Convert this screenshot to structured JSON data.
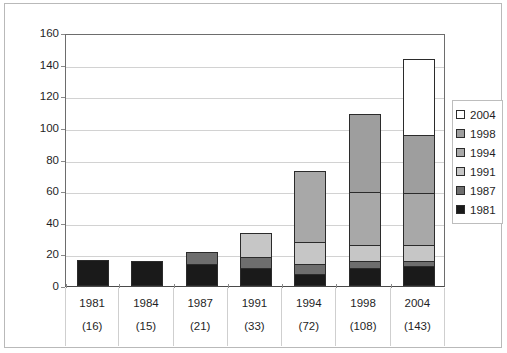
{
  "chart_title": "",
  "legend": {
    "position": "right",
    "entries": [
      {
        "label": "2004",
        "color": "#ffffff"
      },
      {
        "label": "1998",
        "color": "#9e9e9e"
      },
      {
        "label": "1994",
        "color": "#a8a8a8"
      },
      {
        "label": "1991",
        "color": "#c6c6c6"
      },
      {
        "label": "1987",
        "color": "#6e6e6e"
      },
      {
        "label": "1981",
        "color": "#1a1a1a"
      }
    ]
  },
  "axis": {
    "y_ticks": [
      "160",
      "140",
      "120",
      "100",
      "80",
      "60",
      "40",
      "20",
      "0"
    ],
    "x_years": [
      "1981",
      "1984",
      "1987",
      "1991",
      "1994",
      "1998",
      "2004"
    ],
    "x_totals": [
      "(16)",
      "(15)",
      "(21)",
      "(33)",
      "(72)",
      "(108)",
      "(143)"
    ]
  },
  "chart_data": {
    "type": "bar",
    "subtype": "stacked-vertical",
    "title": "",
    "xlabel": "",
    "ylabel": "",
    "ylim": [
      0,
      160
    ],
    "ytick_step": 20,
    "grid": true,
    "legend_position": "right",
    "categories": [
      "1981",
      "1984",
      "1987",
      "1991",
      "1994",
      "1998",
      "2004"
    ],
    "category_totals": [
      16,
      15,
      21,
      33,
      72,
      108,
      143
    ],
    "series": [
      {
        "name": "1981",
        "color": "#1a1a1a",
        "values": [
          16,
          15,
          13,
          11,
          7,
          11,
          12
        ]
      },
      {
        "name": "1987",
        "color": "#6e6e6e",
        "values": [
          0,
          0,
          8,
          7,
          6,
          4,
          3
        ]
      },
      {
        "name": "1991",
        "color": "#c6c6c6",
        "values": [
          0,
          0,
          0,
          15,
          14,
          10,
          10
        ]
      },
      {
        "name": "1994",
        "color": "#a8a8a8",
        "values": [
          0,
          0,
          0,
          0,
          45,
          34,
          33
        ]
      },
      {
        "name": "1998",
        "color": "#9e9e9e",
        "values": [
          0,
          0,
          0,
          0,
          0,
          49,
          37
        ]
      },
      {
        "name": "2004",
        "color": "#ffffff",
        "values": [
          0,
          0,
          0,
          0,
          0,
          0,
          48
        ]
      }
    ]
  }
}
